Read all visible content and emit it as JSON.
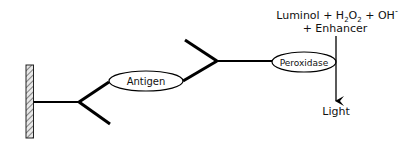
{
  "diagram": {
    "type": "ELISA chemiluminescence detection schematic",
    "nodes": {
      "solid_support": {
        "label": ""
      },
      "antigen": {
        "label": "Antigen"
      },
      "enzyme": {
        "label": "Peroxidase"
      },
      "output": {
        "label": "Light"
      }
    },
    "reagents": {
      "line1_parts": [
        "Luminol + H",
        "2",
        "O",
        "2",
        " + OH",
        "-"
      ],
      "line2": "+ Enhancer"
    },
    "colors": {
      "stroke": "#000000",
      "background": "#ffffff"
    }
  }
}
